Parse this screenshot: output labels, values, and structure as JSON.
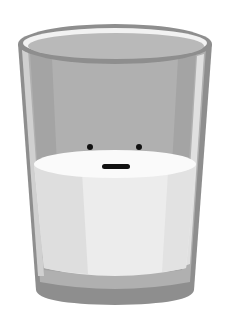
{
  "illustration": {
    "subject": "glass-of-milk-with-face",
    "colors": {
      "background": "#ffffff",
      "glass_outer": "#8e8e8e",
      "glass_body": "#b4b4b4",
      "glass_dark_band": "#a6a6a6",
      "glass_highlight": "#d6d6d6",
      "rim_inner": "#bdbdbd",
      "rim_highlight": "#f2f2f2",
      "milk_body": "#ececec",
      "milk_surface": "#fafafa",
      "milk_shadow": "#dcdcdc",
      "face": "#111111"
    }
  }
}
